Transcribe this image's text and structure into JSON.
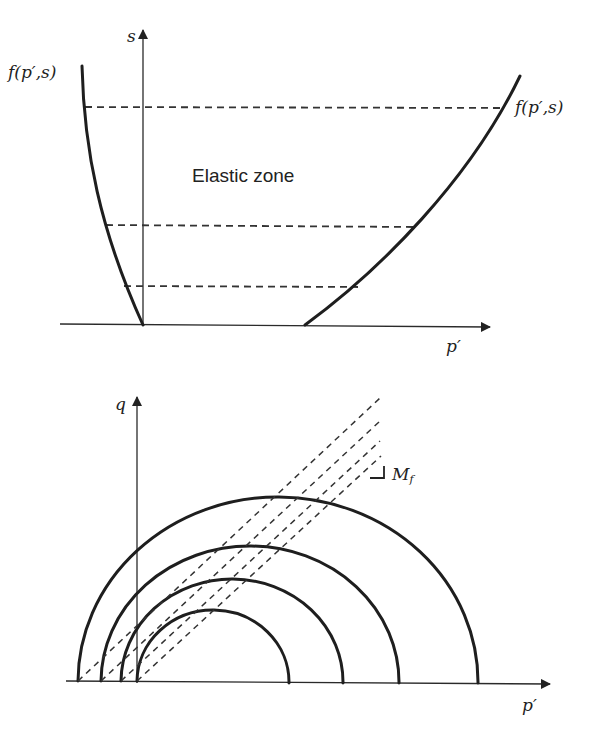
{
  "figure": {
    "top_plot": {
      "y_axis_label": "s",
      "x_axis_label": "p′",
      "left_curve_label": "f(p′,s)",
      "right_curve_label": "f(p′,s)",
      "region_label": "Elastic zone",
      "dashed_levels": 3
    },
    "bottom_plot": {
      "y_axis_label": "q",
      "x_axis_label": "p′",
      "slope_label": "M",
      "slope_label_sub": "f",
      "yield_arcs": 4,
      "critical_state_lines": 4
    }
  },
  "colors": {
    "line": "#1e1e1e",
    "background": "#ffffff"
  }
}
